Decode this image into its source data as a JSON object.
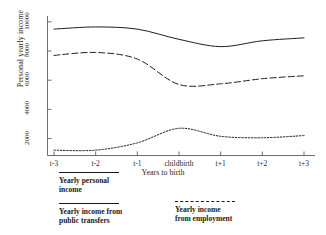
{
  "chart_data": {
    "type": "line",
    "title": "",
    "xlabel": "Years to birth",
    "ylabel": "Personal yearly income",
    "categories": [
      "t-3",
      "t-2",
      "t-1",
      "childbirth",
      "t+1",
      "t+2",
      "t+3"
    ],
    "yticks": [
      2000,
      4000,
      6000,
      8000,
      10000
    ],
    "ytick_labels": [
      "2000",
      "4000",
      "6000",
      "8000",
      "10000"
    ],
    "ylim": [
      800,
      10400
    ],
    "grid": false,
    "legend_position": "below-axes",
    "series": [
      {
        "name": "Yearly personal income",
        "style": "solid",
        "values": [
          9500,
          9650,
          9500,
          8800,
          8300,
          8700,
          8900
        ]
      },
      {
        "name": "Yearly income from employment",
        "style": "dashed",
        "values": [
          7700,
          7900,
          7450,
          5700,
          5750,
          6100,
          6300
        ]
      },
      {
        "name": "Yearly income from public transfers",
        "style": "dotted",
        "values": [
          1200,
          1200,
          1700,
          2700,
          2150,
          2050,
          2200
        ]
      }
    ]
  },
  "axes": {
    "y_title": "Personal yearly income",
    "x_title": "Years to birth"
  },
  "legend": {
    "personal": {
      "line1": "Yearly personal",
      "line2": "income"
    },
    "transfers": {
      "line1": "Yearly income from",
      "line2": "public transfers"
    },
    "employment": {
      "line1": "Yearly income",
      "line2": "from employment"
    }
  }
}
